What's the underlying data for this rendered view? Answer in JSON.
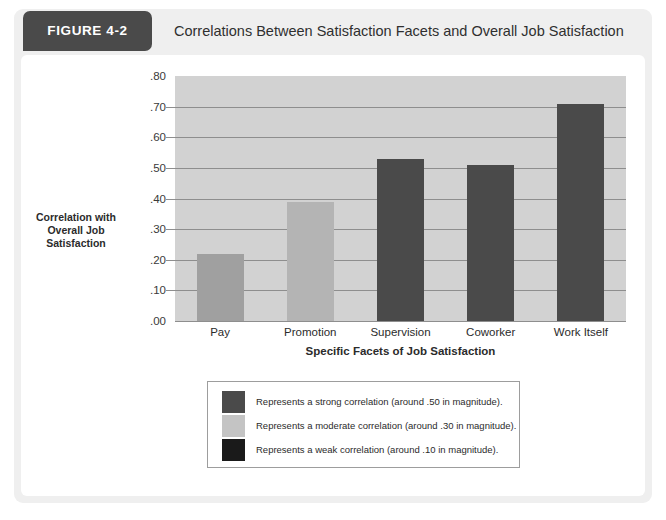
{
  "header": {
    "figure_tag": "FIGURE 4-2",
    "title": "Correlations Between Satisfaction Facets and Overall Job Satisfaction",
    "tab_color": "#4a4a4a"
  },
  "chart_data": {
    "type": "bar",
    "title": "Correlations Between Satisfaction Facets and Overall Job Satisfaction",
    "xlabel": "Specific Facets of Job Satisfaction",
    "ylabel": "Correlation with Overall Job Satisfaction",
    "categories": [
      "Pay",
      "Promotion",
      "Supervision",
      "Coworker",
      "Work Itself"
    ],
    "values": [
      0.22,
      0.39,
      0.53,
      0.51,
      0.71
    ],
    "bar_colors": [
      "#a0a0a0",
      "#b4b4b4",
      "#4a4a4a",
      "#4a4a4a",
      "#4a4a4a"
    ],
    "ylim": [
      0.0,
      0.8
    ],
    "ytick_labels": [
      ".80",
      ".70",
      ".60",
      ".50",
      ".40",
      ".30",
      ".20",
      ".10",
      ".00"
    ],
    "ytick_values": [
      0.8,
      0.7,
      0.6,
      0.5,
      0.4,
      0.3,
      0.2,
      0.1,
      0.0
    ],
    "grid": true,
    "plot_background": "#d2d2d2",
    "gridline_color": "#8e8e8e",
    "legend_position": "below-plot"
  },
  "y_axis_title_lines": {
    "line1": "Correlation with",
    "line2": "Overall Job",
    "line3": "Satisfaction"
  },
  "x_axis_title": "Specific Facets of Job Satisfaction",
  "legend": {
    "entries": [
      {
        "swatch_color": "#4a4a4a",
        "label": "Represents a strong correlation (around .50 in magnitude)."
      },
      {
        "swatch_color": "#c4c4c4",
        "label": "Represents a moderate correlation (around .30 in magnitude)."
      },
      {
        "swatch_color": "#1a1a1a",
        "label": "Represents a weak correlation (around .10 in magnitude)."
      }
    ]
  }
}
